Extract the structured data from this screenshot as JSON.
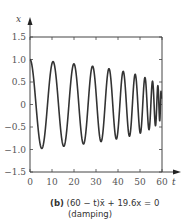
{
  "chart_data": {
    "type": "line",
    "title": "",
    "xlabel": "t",
    "ylabel": "x",
    "xlim": [
      0,
      60
    ],
    "ylim": [
      -1.5,
      1.5
    ],
    "x_ticks": [
      "0",
      "10",
      "20",
      "30",
      "40",
      "50",
      "60"
    ],
    "y_ticks": [
      "1.5",
      "1.0",
      "0.5",
      "0",
      "-0.5",
      "-1.0",
      "-1.5"
    ],
    "grid": false,
    "series": [
      {
        "name": "x(t)",
        "description": "Oscillation with slowly decreasing amplitude and increasing frequency as t approaches 60",
        "approx_peaks": [
          {
            "t": 0,
            "x": 1.0
          },
          {
            "t": 10.5,
            "x": 0.97
          },
          {
            "t": 19.5,
            "x": 0.93
          },
          {
            "t": 28,
            "x": 0.88
          },
          {
            "t": 35.5,
            "x": 0.83
          },
          {
            "t": 42,
            "x": 0.78
          },
          {
            "t": 47.5,
            "x": 0.73
          },
          {
            "t": 52,
            "x": 0.66
          },
          {
            "t": 55.5,
            "x": 0.55
          }
        ],
        "approx_troughs": [
          {
            "t": 5.5,
            "x": -0.95
          },
          {
            "t": 15.5,
            "x": -0.91
          },
          {
            "t": 24,
            "x": -0.87
          },
          {
            "t": 32,
            "x": -0.82
          },
          {
            "t": 39,
            "x": -0.77
          },
          {
            "t": 45,
            "x": -0.72
          },
          {
            "t": 50,
            "x": -0.66
          },
          {
            "t": 54,
            "x": -0.58
          }
        ]
      }
    ]
  },
  "caption": {
    "label": "(b)",
    "equation": "(60 − t)x̄ + 19.6x = 0",
    "note": "(damping)"
  }
}
